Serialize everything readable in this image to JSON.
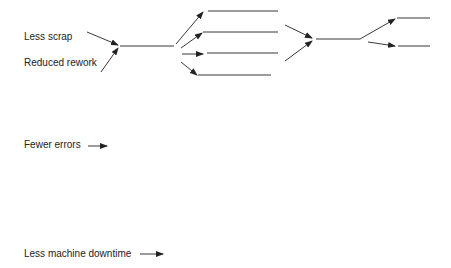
{
  "diagram": {
    "type": "fishbone-tree",
    "colors": {
      "line": "#222222",
      "text": "#222222",
      "background": "#ffffff"
    },
    "labels": [
      {
        "id": "less-scrap",
        "text": "Less scrap",
        "x": 24,
        "y": 31
      },
      {
        "id": "reduced-rework",
        "text": "Reduced rework",
        "x": 24,
        "y": 57
      },
      {
        "id": "fewer-errors",
        "text": "Fewer errors",
        "x": 24,
        "y": 139
      },
      {
        "id": "less-machine-downtime",
        "text": "Less machine downtime",
        "x": 24,
        "y": 248
      }
    ],
    "edges": [
      {
        "from": "less-scrap",
        "to": "junction-1"
      },
      {
        "from": "reduced-rework",
        "to": "junction-1"
      },
      {
        "from": "junction-1",
        "to": "branch-1"
      },
      {
        "from": "junction-1",
        "to": "branch-2"
      },
      {
        "from": "junction-1",
        "to": "branch-3"
      },
      {
        "from": "junction-1",
        "to": "branch-4"
      },
      {
        "from": "branch-2",
        "to": "junction-2"
      },
      {
        "from": "branch-3",
        "to": "junction-2"
      },
      {
        "from": "junction-2",
        "to": "branch-5"
      },
      {
        "from": "junction-2",
        "to": "branch-6"
      }
    ]
  }
}
